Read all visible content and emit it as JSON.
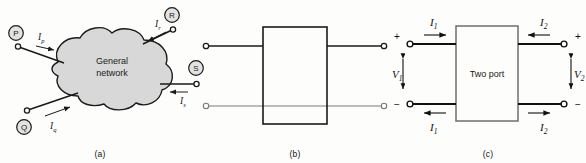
{
  "figure": {
    "panels": [
      {
        "id": "a",
        "caption": "(a)",
        "block_label_line1": "General",
        "block_label_line2": "network",
        "terminals": [
          {
            "name": "P",
            "label": "P",
            "current": "I",
            "current_sub": "p",
            "direction": "into-network"
          },
          {
            "name": "R",
            "label": "R",
            "current": "I",
            "current_sub": "r",
            "direction": "into-network"
          },
          {
            "name": "S",
            "label": "S",
            "current": "I",
            "current_sub": "s",
            "direction": "into-network"
          },
          {
            "name": "Q",
            "label": "Q",
            "current": "I",
            "current_sub": "q",
            "direction": "into-network"
          }
        ]
      },
      {
        "id": "b",
        "caption": "(b)",
        "block_label": "",
        "terminal_count": 4
      },
      {
        "id": "c",
        "caption": "(c)",
        "block_label": "Two port",
        "currents": [
          {
            "name": "I1-top",
            "symbol": "I",
            "sub": "1",
            "direction": "right"
          },
          {
            "name": "I2-top",
            "symbol": "I",
            "sub": "2",
            "direction": "left"
          },
          {
            "name": "I1-bottom",
            "symbol": "I",
            "sub": "1",
            "direction": "left"
          },
          {
            "name": "I2-bottom",
            "symbol": "I",
            "sub": "2",
            "direction": "right"
          }
        ],
        "voltages": [
          {
            "name": "V1",
            "symbol": "V",
            "sub": "1",
            "plus": "+",
            "minus": "−"
          },
          {
            "name": "V2",
            "symbol": "V",
            "sub": "2",
            "plus": "+",
            "minus": "−"
          }
        ]
      }
    ]
  },
  "colors": {
    "ink": "#111111",
    "blob_fill": "#d8d8d8",
    "blob_stroke": "#1a1a1a",
    "thin_line": "#7a7a7a",
    "paper": "#fdfdfb"
  }
}
